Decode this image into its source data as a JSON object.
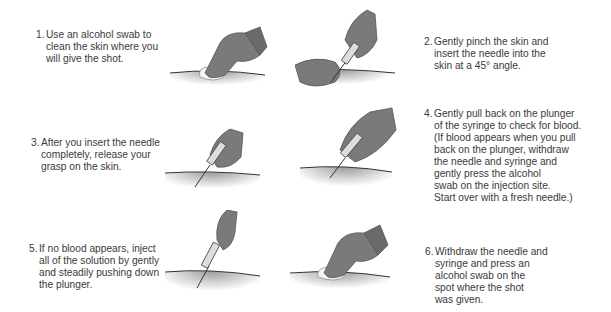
{
  "diagram": {
    "type": "instructional-steps",
    "colors": {
      "glove": "#7a7a7a",
      "glove_dark": "#4f4f4f",
      "skin_shadow": "#a8a8a8",
      "swab": "#f2f2f2",
      "text": "#3a3a3a"
    },
    "steps": [
      {
        "number": "1.",
        "text": "Use an alcohol swab to\nclean the skin where you\nwill give the shot.",
        "illustration": "gloved-hand-wiping-swab"
      },
      {
        "number": "2.",
        "text": "Gently pinch the skin and\ninsert the needle into the\nskin at a 45° angle.",
        "illustration": "pinch-skin-insert-needle"
      },
      {
        "number": "3.",
        "text": "After you insert the needle\ncompletely, release your\ngrasp on the skin.",
        "illustration": "needle-inserted-hand-holding-syringe"
      },
      {
        "number": "4.",
        "text": "Gently pull back on the plunger\nof the syringe to check for blood.\n(If blood appears when you pull\nback on the plunger, withdraw\nthe needle and syringe and\ngently press the alcohol\nswab on the injection site.\nStart over with a fresh needle.)",
        "illustration": "two-hands-pull-plunger"
      },
      {
        "number": "5.",
        "text": "If no blood appears, inject\nall of the solution by gently\nand steadily pushing down\nthe plunger.",
        "illustration": "push-plunger"
      },
      {
        "number": "6.",
        "text": "Withdraw the needle and\nsyringe and press an\nalcohol swab on the\nspot where the shot\nwas given.",
        "illustration": "press-swab-on-site"
      }
    ]
  }
}
